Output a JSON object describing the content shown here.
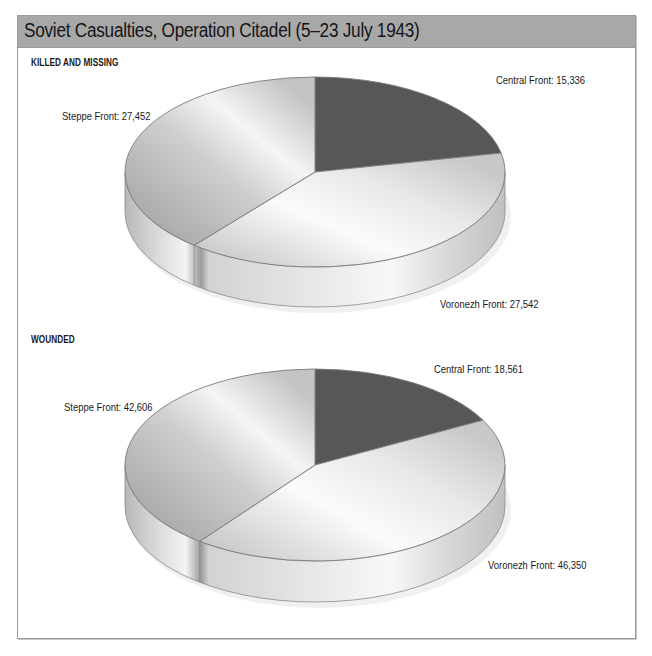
{
  "title": "Soviet Casualties, Operation Citadel (5–23 July 1943)",
  "colors": {
    "title_bar": "#a8a8a8",
    "border": "#9a9a9a",
    "central_slice": "#575757",
    "light_slice": "#e6e6e6"
  },
  "sections": [
    {
      "label": "KILLED AND MISSING",
      "slices": [
        {
          "name": "Central Front",
          "value": 15336,
          "label": "Central Front: 15,336"
        },
        {
          "name": "Voronezh Front",
          "value": 27542,
          "label": "Voronezh Front: 27,542"
        },
        {
          "name": "Steppe Front",
          "value": 27452,
          "label": "Steppe Front: 27,452"
        }
      ]
    },
    {
      "label": "WOUNDED",
      "slices": [
        {
          "name": "Central Front",
          "value": 18561,
          "label": "Central Front: 18,561"
        },
        {
          "name": "Voronezh Front",
          "value": 46350,
          "label": "Voronezh Front: 46,350"
        },
        {
          "name": "Steppe Front",
          "value": 42606,
          "label": "Steppe Front: 42,606"
        }
      ]
    }
  ],
  "chart_data": [
    {
      "type": "pie",
      "title": "Soviet Casualties, Operation Citadel (5–23 July 1943) — KILLED AND MISSING",
      "categories": [
        "Central Front",
        "Voronezh Front",
        "Steppe Front"
      ],
      "values": [
        15336,
        27542,
        27452
      ],
      "style": "3d",
      "legend": "none (direct labels)"
    },
    {
      "type": "pie",
      "title": "Soviet Casualties, Operation Citadel (5–23 July 1943) — WOUNDED",
      "categories": [
        "Central Front",
        "Voronezh Front",
        "Steppe Front"
      ],
      "values": [
        18561,
        46350,
        42606
      ],
      "style": "3d",
      "legend": "none (direct labels)"
    }
  ]
}
